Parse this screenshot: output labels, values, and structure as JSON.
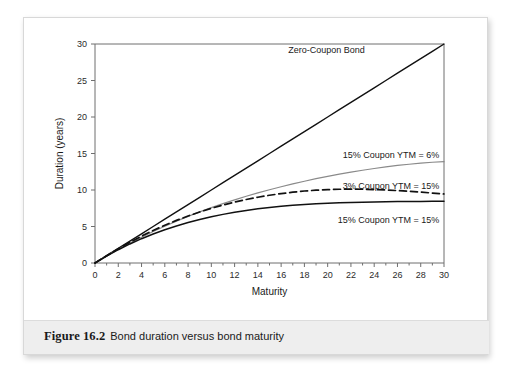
{
  "figure": {
    "number": "Figure 16.2",
    "description": "Bond duration versus bond maturity"
  },
  "chart_data": {
    "type": "line",
    "title": "",
    "xlabel": "Maturity",
    "ylabel": "Duration (years)",
    "xlim": [
      0,
      30
    ],
    "ylim": [
      0,
      30
    ],
    "grid": false,
    "legend_position": "inline-annotations",
    "xticks": [
      0,
      2,
      4,
      6,
      8,
      10,
      12,
      14,
      16,
      18,
      20,
      22,
      24,
      26,
      28,
      30
    ],
    "yticks": [
      0,
      5,
      10,
      15,
      20,
      25,
      30
    ],
    "x": [
      0,
      1,
      2,
      3,
      4,
      5,
      6,
      7,
      8,
      9,
      10,
      11,
      12,
      13,
      14,
      15,
      16,
      17,
      18,
      19,
      20,
      21,
      22,
      23,
      24,
      25,
      26,
      27,
      28,
      29,
      30
    ],
    "series": [
      {
        "name": "Zero-Coupon Bond",
        "label": "Zero-Coupon Bond",
        "color": "#111111",
        "style": "solid",
        "width": 1.4,
        "label_x": 23.2,
        "label_y": 29.2,
        "label_anchor": "end",
        "values": [
          0,
          1,
          2,
          3,
          4,
          5,
          6,
          7,
          8,
          9,
          10,
          11,
          12,
          13,
          14,
          15,
          16,
          17,
          18,
          19,
          20,
          21,
          22,
          23,
          24,
          25,
          26,
          27,
          28,
          29,
          30
        ]
      },
      {
        "name": "15% Coupon YTM = 6%",
        "label": "15% Coupon YTM = 6%",
        "color": "#8a8a8a",
        "style": "solid",
        "width": 1.2,
        "label_x": 29.6,
        "label_y": 14.9,
        "label_anchor": "end",
        "values": [
          0,
          0.96,
          1.87,
          2.73,
          3.54,
          4.31,
          5.04,
          5.73,
          6.38,
          7.0,
          7.58,
          8.13,
          8.65,
          9.14,
          9.6,
          10.04,
          10.45,
          10.84,
          11.2,
          11.55,
          11.87,
          12.17,
          12.45,
          12.71,
          12.95,
          13.17,
          13.36,
          13.53,
          13.68,
          13.8,
          13.88
        ]
      },
      {
        "name": "3% Coupon YTM = 15%",
        "label": "3% Coupon YTM = 15%",
        "color": "#111111",
        "style": "dashed",
        "width": 1.7,
        "label_x": 29.6,
        "label_y": 10.55,
        "label_anchor": "end",
        "values": [
          0,
          1.0,
          1.95,
          2.84,
          3.68,
          4.46,
          5.18,
          5.84,
          6.44,
          6.99,
          7.49,
          7.94,
          8.34,
          8.7,
          9.01,
          9.28,
          9.51,
          9.7,
          9.86,
          9.97,
          10.05,
          10.1,
          10.12,
          10.1,
          10.06,
          10.0,
          9.92,
          9.82,
          9.71,
          9.58,
          9.45
        ]
      },
      {
        "name": "15% Coupon YTM = 15%",
        "label": "15% Coupon YTM = 15%",
        "color": "#111111",
        "style": "solid",
        "width": 1.5,
        "label_x": 29.6,
        "label_y": 6.0,
        "label_anchor": "end",
        "values": [
          0,
          0.95,
          1.82,
          2.61,
          3.33,
          3.98,
          4.56,
          5.08,
          5.54,
          5.96,
          6.33,
          6.66,
          6.95,
          7.2,
          7.42,
          7.61,
          7.77,
          7.9,
          8.01,
          8.1,
          8.18,
          8.24,
          8.29,
          8.33,
          8.36,
          8.39,
          8.41,
          8.43,
          8.44,
          8.45,
          8.46
        ]
      }
    ]
  }
}
